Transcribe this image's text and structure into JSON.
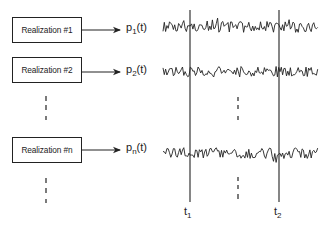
{
  "diagram": {
    "realizations": [
      {
        "label": "Realization #1",
        "output_base": "p",
        "output_sub": "1",
        "output_suffix": "(t)",
        "box_y": 17,
        "signal_y": 27
      },
      {
        "label": "Realization #2",
        "output_base": "p",
        "output_sub": "2",
        "output_suffix": "(t)",
        "box_y": 57,
        "signal_y": 72
      },
      {
        "label": "Realization #n",
        "output_base": "p",
        "output_sub": "n",
        "output_suffix": "(t)",
        "box_y": 135,
        "signal_y": 153
      }
    ],
    "time_markers": [
      {
        "base": "t",
        "sub": "1",
        "x": 190
      },
      {
        "base": "t",
        "sub": "2",
        "x": 279
      }
    ],
    "ellipsis_note": "vertical dashed continuation marks between realization #2 and #n, and below #n",
    "colors": {
      "ink": "#222222",
      "background": "#ffffff"
    }
  }
}
